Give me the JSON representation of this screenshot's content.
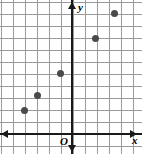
{
  "figure": {
    "type": "coordinate-grid-scatter",
    "origin_label": "O",
    "x_axis_label": "x",
    "y_axis_label": "y",
    "grid_color": "#9a9a9a",
    "axis_color": "#1a1a1a",
    "point_color": "#4a4a4a",
    "background": "#ffffff"
  },
  "chart_data": {
    "type": "scatter",
    "title": "",
    "xlabel": "x",
    "ylabel": "y",
    "grid": true,
    "legend": "none",
    "xlim": [
      -6,
      5
    ],
    "ylim": [
      -1,
      11
    ],
    "unit_px": 12,
    "origin_px": {
      "x": 72,
      "y": 134
    },
    "x": [
      -4,
      -3,
      -1,
      2,
      3.5
    ],
    "y": [
      2,
      3.25,
      5,
      8,
      10
    ],
    "points_px": [
      {
        "x": 24,
        "y": 110
      },
      {
        "x": 37,
        "y": 95
      },
      {
        "x": 60,
        "y": 73
      },
      {
        "x": 95,
        "y": 38
      },
      {
        "x": 114,
        "y": 13
      }
    ],
    "tick_labels_x": [],
    "tick_labels_y": [],
    "annotations": [
      "O"
    ]
  },
  "gridlines": {
    "vertical_px": [
      1,
      13,
      25,
      37,
      49,
      61,
      73,
      85,
      97,
      109,
      121,
      133
    ],
    "horizontal_px": [
      2,
      14,
      26,
      38,
      50,
      62,
      74,
      86,
      98,
      110,
      122,
      134,
      146
    ]
  }
}
